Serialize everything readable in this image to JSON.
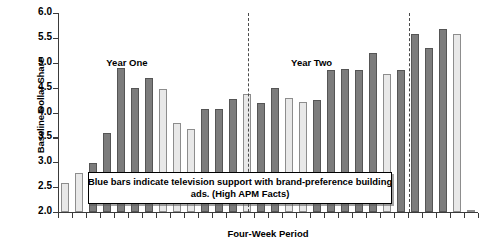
{
  "chart_data": {
    "type": "bar",
    "title": "",
    "xlabel": "Four-Week Period",
    "ylabel": "Baseline Dollar Share",
    "ylim": [
      2.0,
      6.0
    ],
    "grid": false,
    "legend_position": "inside-bottom-center",
    "y_ticks": [
      "6.0",
      "5.5",
      "5.0",
      "4.5",
      "4.0",
      "3.5",
      "3.0",
      "2.5",
      "2.0"
    ],
    "y_tick_values": [
      6.0,
      5.5,
      5.0,
      4.5,
      4.0,
      3.5,
      3.0,
      2.5,
      2.0
    ],
    "categories": [
      "1",
      "2",
      "3",
      "4",
      "5",
      "6",
      "7",
      "8",
      "9",
      "10",
      "11",
      "12",
      "13",
      "14",
      "15",
      "16",
      "17",
      "18",
      "19",
      "20",
      "21",
      "22",
      "23",
      "24",
      "25",
      "26",
      "27",
      "28",
      "29",
      "30"
    ],
    "values": [
      2.58,
      2.78,
      2.98,
      3.59,
      4.89,
      4.49,
      4.69,
      4.48,
      3.79,
      3.67,
      4.08,
      4.08,
      4.28,
      4.38,
      4.2,
      4.5,
      4.3,
      4.22,
      4.26,
      4.85,
      4.87,
      4.86,
      5.19,
      4.78,
      4.86,
      5.58,
      5.3,
      5.67,
      5.58,
      2.05
    ],
    "shades": [
      "light",
      "light",
      "dark",
      "dark",
      "dark",
      "dark",
      "dark",
      "light",
      "light",
      "light",
      "dark",
      "dark",
      "dark",
      "light",
      "dark",
      "dark",
      "light",
      "light",
      "dark",
      "dark",
      "dark",
      "dark",
      "dark",
      "light",
      "dark",
      "dark",
      "dark",
      "dark",
      "light",
      "light"
    ],
    "series": [
      {
        "name": "Blue bars (television support)",
        "shade": "dark",
        "color": "#7c7c7c"
      },
      {
        "name": "Other bars (no television support)",
        "shade": "light",
        "color": "#e8e8e8"
      }
    ],
    "annotations": [
      {
        "name": "year-one-label",
        "text": "Year One",
        "x_fraction": 0.115,
        "y_value": 5.0
      },
      {
        "name": "year-two-label",
        "text": "Year Two",
        "x_fraction": 0.555,
        "y_value": 5.0
      },
      {
        "name": "legend-callout",
        "lines": [
          "Blue bars indicate television support with brand-preference building",
          "ads. (High APM Facts)"
        ]
      }
    ],
    "dividers": [
      {
        "name": "year-one-year-two-divider",
        "x_fraction": 0.452
      },
      {
        "name": "year-two-end-divider",
        "x_fraction": 0.836
      }
    ]
  },
  "axes": {
    "y_title": "Baseline Dollar Share",
    "x_title": "Four-Week Period"
  },
  "labels": {
    "year_one": "Year One",
    "year_two": "Year Two"
  },
  "callout": {
    "line1": "Blue bars indicate television support with brand-preference building",
    "line2": "ads. (High APM Facts)"
  },
  "colors": {
    "dark_bar": "#7c7c7c",
    "light_bar": "#e8e8e8",
    "axis": "#3a3a3a",
    "text": "#000000",
    "background": "#ffffff"
  }
}
